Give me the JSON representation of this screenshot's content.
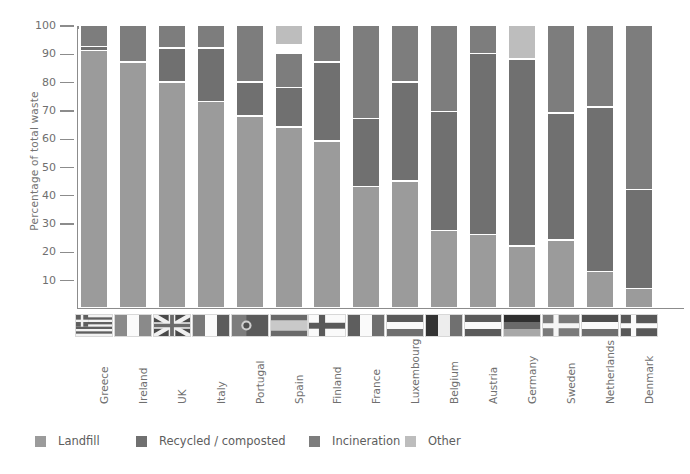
{
  "chart_data": {
    "type": "bar",
    "subtype": "stacked-bar-100-percent",
    "title": "",
    "xlabel": "",
    "ylabel": "Percentage of total waste",
    "ylim": [
      0,
      100
    ],
    "yticks": [
      10,
      20,
      30,
      40,
      50,
      60,
      70,
      80,
      90,
      100
    ],
    "ytick_labels": [
      "10",
      "20",
      "30",
      "40",
      "50",
      "60",
      "70",
      "80",
      "90",
      "100"
    ],
    "grid": false,
    "legend_position": "bottom",
    "categories": [
      "Greece",
      "Ireland",
      "UK",
      "Italy",
      "Portugal",
      "Spain",
      "Finland",
      "France",
      "Luxembourg",
      "Belgium",
      "Austria",
      "Germany",
      "Sweden",
      "Netherlands",
      "Denmark"
    ],
    "series": [
      {
        "name": "Landfill",
        "color": "#9b9b9b",
        "values": [
          91,
          87,
          80,
          73,
          68,
          64,
          59,
          43,
          45,
          27.5,
          26,
          22,
          24,
          13,
          7
        ]
      },
      {
        "name": "Recycled / composted",
        "color": "#707070",
        "values": [
          1.5,
          0,
          12,
          19,
          12,
          14,
          28,
          24,
          35,
          42,
          64,
          66,
          45,
          58,
          35
        ]
      },
      {
        "name": "Incineration",
        "color": "#7d7d7d",
        "values": [
          7.5,
          13,
          8,
          8,
          20,
          15,
          13,
          33,
          20,
          30.5,
          10,
          0,
          31,
          29,
          58
        ]
      },
      {
        "name": "Other",
        "color": "#bdbdbd",
        "values": [
          0,
          0,
          0,
          0,
          0,
          7,
          0,
          0,
          0,
          0,
          0,
          12,
          0,
          0,
          0
        ]
      }
    ],
    "stack_order_top_to_bottom": [
      "Other",
      "Incineration",
      "Recycled / composted",
      "Landfill"
    ],
    "stacks": [
      {
        "country": "Greece",
        "segments": [
          {
            "name": "Incineration",
            "from": 92.5,
            "to": 100
          },
          {
            "name": "Recycled / composted",
            "from": 91,
            "to": 92.5
          },
          {
            "name": "Landfill",
            "from": 0,
            "to": 91
          }
        ]
      },
      {
        "country": "Ireland",
        "segments": [
          {
            "name": "Incineration",
            "from": 87,
            "to": 100
          },
          {
            "name": "Landfill",
            "from": 0,
            "to": 87
          }
        ]
      },
      {
        "country": "UK",
        "segments": [
          {
            "name": "Incineration",
            "from": 92,
            "to": 100
          },
          {
            "name": "Recycled / composted",
            "from": 80,
            "to": 92
          },
          {
            "name": "Landfill",
            "from": 0,
            "to": 80
          }
        ]
      },
      {
        "country": "Italy",
        "segments": [
          {
            "name": "Incineration",
            "from": 92,
            "to": 100
          },
          {
            "name": "Recycled / composted",
            "from": 73,
            "to": 92
          },
          {
            "name": "Landfill",
            "from": 0,
            "to": 73
          }
        ]
      },
      {
        "country": "Portugal",
        "segments": [
          {
            "name": "Incineration",
            "from": 80,
            "to": 100
          },
          {
            "name": "Recycled / composted",
            "from": 68,
            "to": 80
          },
          {
            "name": "Landfill",
            "from": 0,
            "to": 68
          }
        ]
      },
      {
        "country": "Spain",
        "segments": [
          {
            "name": "Other",
            "from": 93,
            "to": 100
          },
          {
            "name": "Incineration",
            "from": 78,
            "to": 90
          },
          {
            "name": "Recycled / composted",
            "from": 64,
            "to": 78
          },
          {
            "name": "Landfill",
            "from": 0,
            "to": 64
          }
        ]
      },
      {
        "country": "Finland",
        "segments": [
          {
            "name": "Incineration",
            "from": 87,
            "to": 100
          },
          {
            "name": "Recycled / composted",
            "from": 59,
            "to": 87
          },
          {
            "name": "Landfill",
            "from": 0,
            "to": 59
          }
        ]
      },
      {
        "country": "France",
        "segments": [
          {
            "name": "Incineration",
            "from": 67,
            "to": 100
          },
          {
            "name": "Recycled / composted",
            "from": 43,
            "to": 67
          },
          {
            "name": "Landfill",
            "from": 0,
            "to": 43
          }
        ]
      },
      {
        "country": "Luxembourg",
        "segments": [
          {
            "name": "Incineration",
            "from": 80,
            "to": 100
          },
          {
            "name": "Recycled / composted",
            "from": 45,
            "to": 80
          },
          {
            "name": "Landfill",
            "from": 0,
            "to": 45
          }
        ]
      },
      {
        "country": "Belgium",
        "segments": [
          {
            "name": "Incineration",
            "from": 69.5,
            "to": 100
          },
          {
            "name": "Recycled / composted",
            "from": 27.5,
            "to": 69.5
          },
          {
            "name": "Landfill",
            "from": 0,
            "to": 27.5
          }
        ]
      },
      {
        "country": "Austria",
        "segments": [
          {
            "name": "Incineration",
            "from": 90,
            "to": 100
          },
          {
            "name": "Recycled / composted",
            "from": 26,
            "to": 90
          },
          {
            "name": "Landfill",
            "from": 0,
            "to": 26
          }
        ]
      },
      {
        "country": "Germany",
        "segments": [
          {
            "name": "Other",
            "from": 88,
            "to": 100
          },
          {
            "name": "Recycled / composted",
            "from": 22,
            "to": 88
          },
          {
            "name": "Landfill",
            "from": 0,
            "to": 22
          }
        ]
      },
      {
        "country": "Sweden",
        "segments": [
          {
            "name": "Incineration",
            "from": 69,
            "to": 100
          },
          {
            "name": "Recycled / composted",
            "from": 24,
            "to": 69
          },
          {
            "name": "Landfill",
            "from": 0,
            "to": 24
          }
        ]
      },
      {
        "country": "Netherlands",
        "segments": [
          {
            "name": "Incineration",
            "from": 71,
            "to": 100
          },
          {
            "name": "Recycled / composted",
            "from": 13,
            "to": 71
          },
          {
            "name": "Landfill",
            "from": 0,
            "to": 13
          }
        ]
      },
      {
        "country": "Denmark",
        "segments": [
          {
            "name": "Incineration",
            "from": 42,
            "to": 100
          },
          {
            "name": "Recycled / composted",
            "from": 7,
            "to": 42
          },
          {
            "name": "Landfill",
            "from": 0,
            "to": 7
          }
        ]
      }
    ]
  },
  "legend": {
    "items": [
      {
        "label": "Landfill",
        "color": "#9b9b9b",
        "x": 35
      },
      {
        "label": "Recycled / composted",
        "color": "#707070",
        "x": 136
      },
      {
        "label": "Incineration",
        "color": "#7d7d7d",
        "x": 309
      },
      {
        "label": "Other",
        "color": "#bdbdbd",
        "x": 405
      }
    ]
  },
  "flags": {
    "items": [
      {
        "country": "Greece",
        "icon": "flag-greece"
      },
      {
        "country": "Ireland",
        "icon": "flag-ireland"
      },
      {
        "country": "UK",
        "icon": "flag-uk"
      },
      {
        "country": "Italy",
        "icon": "flag-italy"
      },
      {
        "country": "Portugal",
        "icon": "flag-portugal"
      },
      {
        "country": "Spain",
        "icon": "flag-spain"
      },
      {
        "country": "Finland",
        "icon": "flag-finland"
      },
      {
        "country": "France",
        "icon": "flag-france"
      },
      {
        "country": "Luxembourg",
        "icon": "flag-luxembourg"
      },
      {
        "country": "Belgium",
        "icon": "flag-belgium"
      },
      {
        "country": "Austria",
        "icon": "flag-austria"
      },
      {
        "country": "Germany",
        "icon": "flag-germany"
      },
      {
        "country": "Sweden",
        "icon": "flag-sweden"
      },
      {
        "country": "Netherlands",
        "icon": "flag-netherlands"
      },
      {
        "country": "Denmark",
        "icon": "flag-denmark"
      }
    ]
  },
  "axis": {
    "colors": {
      "axis_line": "#8c8c8c",
      "text": "#6f6f6f",
      "background": "#ffffff"
    }
  }
}
